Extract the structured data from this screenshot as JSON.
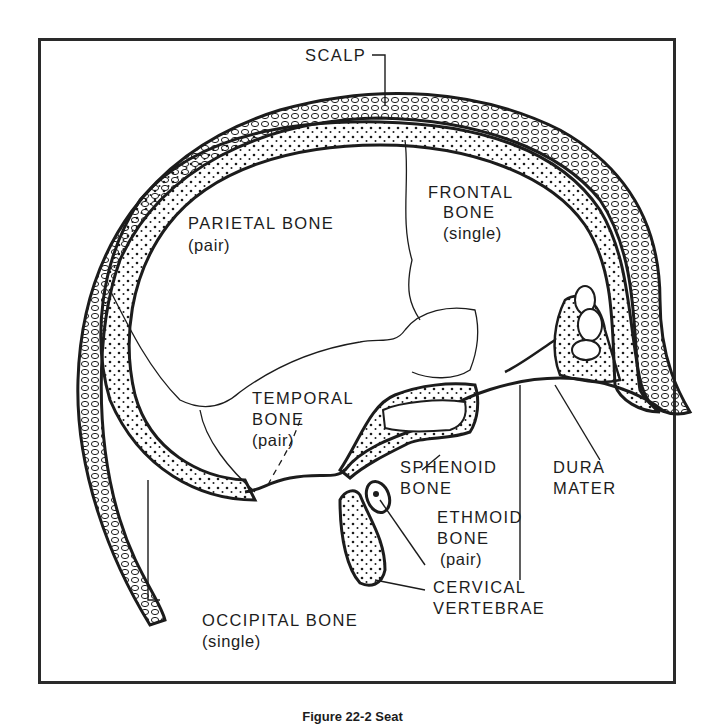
{
  "figure": {
    "caption": "Figure 22-2  Seat",
    "colors": {
      "ink": "#1c1c1c",
      "frame": "#2a2a2a",
      "background": "#ffffff"
    }
  },
  "labels": {
    "scalp": "SCALP",
    "frontal": {
      "name1": "FRONTAL",
      "name2": "BONE",
      "note": "(single)"
    },
    "parietal": {
      "name": "PARIETAL BONE",
      "note": "(pair)"
    },
    "temporal": {
      "name1": "TEMPORAL",
      "name2": "BONE",
      "note": "(pair)"
    },
    "sphenoid": {
      "name1": "SPHENOID",
      "name2": "BONE"
    },
    "dura": {
      "name1": "DURA",
      "name2": "MATER"
    },
    "ethmoid": {
      "name1": "ETHMOID",
      "name2": "BONE",
      "note": "(pair)"
    },
    "cervical": {
      "name1": "CERVICAL",
      "name2": "VERTEBRAE"
    },
    "occipital": {
      "name": "OCCIPITAL BONE",
      "note": "(single)"
    }
  }
}
